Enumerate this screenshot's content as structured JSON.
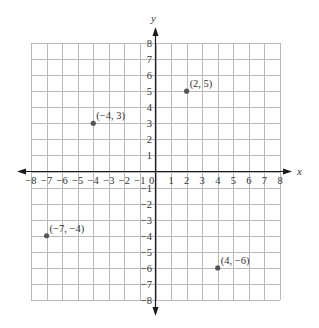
{
  "chart_data": {
    "type": "scatter",
    "title": "",
    "xlabel": "x",
    "ylabel": "y",
    "xlim": [
      -8,
      8
    ],
    "ylim": [
      -8,
      8
    ],
    "grid": true,
    "legend": null,
    "x_ticks": [
      -8,
      -7,
      -6,
      -5,
      -4,
      -3,
      -2,
      -1,
      0,
      1,
      2,
      3,
      4,
      5,
      6,
      7,
      8
    ],
    "y_ticks": [
      -8,
      -7,
      -6,
      -5,
      -4,
      -3,
      -2,
      -1,
      1,
      2,
      3,
      4,
      5,
      6,
      7,
      8
    ],
    "x_tick_labels": [
      "−8",
      "−7",
      "−6",
      "−5",
      "−4",
      "−3",
      "−2",
      "−1",
      "0",
      "1",
      "2",
      "3",
      "4",
      "5",
      "6",
      "7",
      "8"
    ],
    "y_tick_labels": [
      "−8",
      "−7",
      "−6",
      "−5",
      "−4",
      "−3",
      "−2",
      "−1",
      "1",
      "2",
      "3",
      "4",
      "5",
      "6",
      "7",
      "8"
    ],
    "points": [
      {
        "x": 2,
        "y": 5,
        "label": "(2, 5)"
      },
      {
        "x": -4,
        "y": 3,
        "label": "(−4, 3)"
      },
      {
        "x": -7,
        "y": -4,
        "label": "(−7, −4)"
      },
      {
        "x": 4,
        "y": -6,
        "label": "(4, −6)"
      }
    ]
  },
  "colors": {
    "grid": "#b9b9b9",
    "axis": "#1a1a1a",
    "point": "#555555",
    "text": "#333333"
  }
}
